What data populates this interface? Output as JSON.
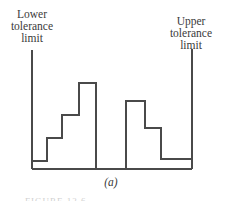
{
  "figure": {
    "subfigure_label": "(a)",
    "caption_partial": "FIGURE 12.6"
  },
  "labels": {
    "lower": [
      "Lower",
      "tolerance",
      "limit"
    ],
    "upper": [
      "Upper",
      "tolerance",
      "limit"
    ]
  },
  "colors": {
    "line": "#4a4a4a",
    "text": "#3a3a3a",
    "background": "#ffffff"
  },
  "diagram": {
    "baseline_y": 169,
    "lower_limit_x": 32,
    "upper_limit_x": 192,
    "left_histogram": {
      "description": "bimodal-split distribution, left mode rising toward center",
      "steps": [
        {
          "x0": 32,
          "x1": 47,
          "top": 161
        },
        {
          "x0": 47,
          "x1": 62,
          "top": 138
        },
        {
          "x0": 62,
          "x1": 79,
          "top": 115
        },
        {
          "x0": 79,
          "x1": 96,
          "top": 83
        }
      ]
    },
    "right_histogram": {
      "description": "right mode falling toward upper limit",
      "steps": [
        {
          "x0": 126,
          "x1": 145,
          "top": 101
        },
        {
          "x0": 145,
          "x1": 161,
          "top": 128
        },
        {
          "x0": 161,
          "x1": 176,
          "top": 159
        },
        {
          "x0": 176,
          "x1": 192,
          "top": 159
        }
      ]
    }
  }
}
